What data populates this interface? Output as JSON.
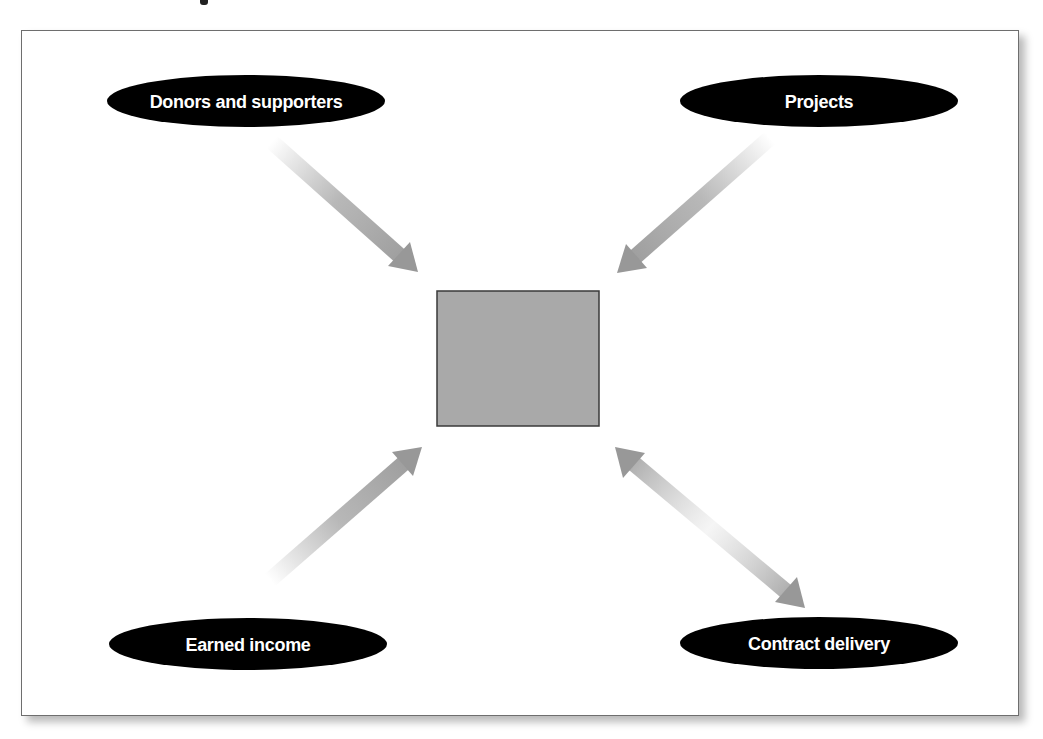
{
  "diagram": {
    "type": "hub-and-spoke",
    "center": {
      "label": "",
      "fill": "#a9a9a9",
      "stroke": "#3a3a3a"
    },
    "nodes": [
      {
        "id": "donors",
        "label": "Donors and supporters",
        "position": "top-left"
      },
      {
        "id": "projects",
        "label": "Projects",
        "position": "top-right"
      },
      {
        "id": "earned",
        "label": "Earned income",
        "position": "bottom-left"
      },
      {
        "id": "contract",
        "label": "Contract delivery",
        "position": "bottom-right"
      }
    ],
    "edges": [
      {
        "from": "donors",
        "to": "center",
        "direction": "one-way"
      },
      {
        "from": "projects",
        "to": "center",
        "direction": "one-way"
      },
      {
        "from": "earned",
        "to": "center",
        "direction": "one-way"
      },
      {
        "from": "contract",
        "to": "center",
        "direction": "two-way"
      }
    ],
    "colors": {
      "node_fill": "#000000",
      "node_text": "#ffffff",
      "arrow": "#9a9a9a",
      "frame_border": "#6e6e6e"
    }
  }
}
